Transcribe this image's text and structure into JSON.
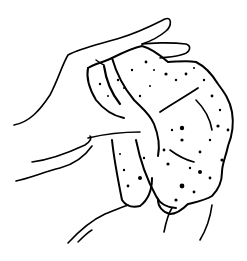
{
  "illustration": {
    "description": "Line drawing of hands squeezing a rough textured sponge-like object",
    "colors": {
      "background": "#ffffff",
      "ink": "#000000"
    },
    "elements": [
      "upper-hand",
      "lower-thumb",
      "lower-hand",
      "textured-object"
    ]
  }
}
